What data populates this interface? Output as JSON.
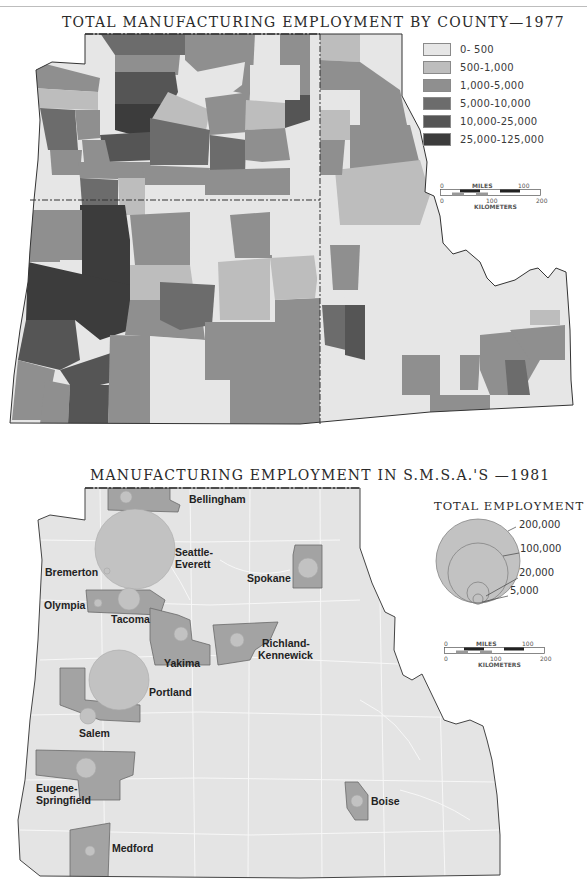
{
  "page": {
    "top_map": {
      "title": "TOTAL MANUFACTURING EMPLOYMENT BY COUNTY—1977",
      "legend": [
        {
          "label": "0- 500",
          "color": "#e6e6e6"
        },
        {
          "label": "500-1,000",
          "color": "#bdbdbd"
        },
        {
          "label": "1,000-5,000",
          "color": "#8f8f8f"
        },
        {
          "label": "5,000-10,000",
          "color": "#6c6c6c"
        },
        {
          "label": "10,000-25,000",
          "color": "#555555"
        },
        {
          "label": "25,000-125,000",
          "color": "#3c3c3c"
        }
      ],
      "scale_bar": {
        "miles_label": "MILES",
        "miles_0": "0",
        "miles_100": "100",
        "km_label": "KILOMETERS",
        "km_0": "0",
        "km_100": "100",
        "km_200": "200"
      }
    },
    "bottom_map": {
      "title": "MANUFACTURING EMPLOYMENT IN S.M.S.A.'S —1981",
      "legend_title": "TOTAL EMPLOYMENT",
      "bubble_legend": [
        {
          "label": "200,000"
        },
        {
          "label": "100,000"
        },
        {
          "label": "20,000"
        },
        {
          "label": "5,000"
        }
      ],
      "scale_bar": {
        "miles_label": "MILES",
        "miles_0": "0",
        "miles_100": "100",
        "km_label": "KILOMETERS",
        "km_0": "0",
        "km_100": "100",
        "km_200": "200"
      },
      "smsas": [
        {
          "name": "Bellingham"
        },
        {
          "name": "Seattle-",
          "name2": "Everett"
        },
        {
          "name": "Bremerton"
        },
        {
          "name": "Olympia"
        },
        {
          "name": "Tacoma"
        },
        {
          "name": "Spokane"
        },
        {
          "name": "Yakima"
        },
        {
          "name": "Richland-",
          "name2": "Kennewick"
        },
        {
          "name": "Portland"
        },
        {
          "name": "Salem"
        },
        {
          "name": "Eugene-",
          "name2": "Springfield"
        },
        {
          "name": "Medford"
        },
        {
          "name": "Boise"
        }
      ]
    }
  }
}
